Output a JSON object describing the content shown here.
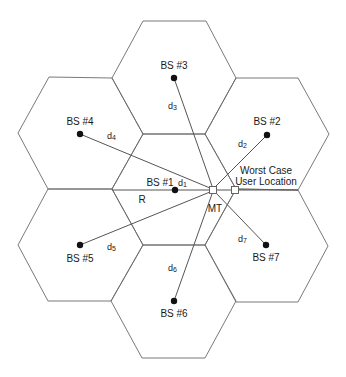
{
  "diagram": {
    "type": "hexagonal-cellular-layout",
    "cell_radius_px": 62,
    "colors": {
      "hex_stroke": "#6a6a6a",
      "link_stroke": "#555555",
      "dot_fill": "#111111",
      "text": "#1a1a1a"
    },
    "base_stations": [
      {
        "id": "bs1",
        "label": "BS #1",
        "x": 175,
        "y": 190
      },
      {
        "id": "bs2",
        "label": "BS #2",
        "x": 267,
        "y": 135
      },
      {
        "id": "bs3",
        "label": "BS #3",
        "x": 174,
        "y": 78
      },
      {
        "id": "bs4",
        "label": "BS #4",
        "x": 80,
        "y": 134
      },
      {
        "id": "bs5",
        "label": "BS #5",
        "x": 80,
        "y": 245
      },
      {
        "id": "bs6",
        "label": "BS #6",
        "x": 174,
        "y": 301
      },
      {
        "id": "bs7",
        "label": "BS #7",
        "x": 266,
        "y": 245
      }
    ],
    "distances": [
      {
        "id": "d1",
        "base": "d",
        "sub": "1",
        "from": "bs1"
      },
      {
        "id": "d2",
        "base": "d",
        "sub": "2",
        "from": "bs2"
      },
      {
        "id": "d3",
        "base": "d",
        "sub": "3",
        "from": "bs3"
      },
      {
        "id": "d4",
        "base": "d",
        "sub": "4",
        "from": "bs4"
      },
      {
        "id": "d5",
        "base": "d",
        "sub": "5",
        "from": "bs5"
      },
      {
        "id": "d6",
        "base": "d",
        "sub": "6",
        "from": "bs6"
      },
      {
        "id": "d7",
        "base": "d",
        "sub": "7",
        "from": "bs7"
      }
    ],
    "radius_label": "R",
    "mobile_terminal": {
      "label": "MT",
      "x": 213,
      "y": 190
    },
    "worst_case": {
      "line1": "Worst Case",
      "line2": "User Location",
      "x": 235,
      "y": 190
    }
  }
}
